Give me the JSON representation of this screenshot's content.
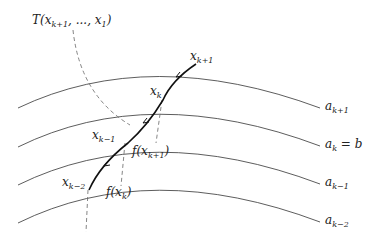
{
  "diagram": {
    "title_label": "T(x_{k+1}, ..., x_1)",
    "level_curves": [
      {
        "name": "a_{k+1}",
        "label_main": "a",
        "label_sub": "k+1",
        "label_suffix": ""
      },
      {
        "name": "a_k = b",
        "label_main": "a",
        "label_sub": "k",
        "label_suffix": " = b"
      },
      {
        "name": "a_{k-1}",
        "label_main": "a",
        "label_sub": "k−1",
        "label_suffix": ""
      },
      {
        "name": "a_{k-2}",
        "label_main": "a",
        "label_sub": "k−2",
        "label_suffix": ""
      }
    ],
    "points": [
      {
        "name": "x_{k+1}",
        "main": "x",
        "sub": "k+1"
      },
      {
        "name": "x_k",
        "main": "x",
        "sub": "k"
      },
      {
        "name": "x_{k-1}",
        "main": "x",
        "sub": "k−1"
      },
      {
        "name": "x_{k-2}",
        "main": "x",
        "sub": "k−2"
      }
    ],
    "images": [
      {
        "name": "f(x_{k+1})",
        "pre": "f(x",
        "sub": "k+1",
        "post": ")"
      },
      {
        "name": "f(x_k)",
        "pre": "f(x",
        "sub": "k",
        "post": ")"
      }
    ],
    "T_label": {
      "pre": "T(x",
      "sub1": "k+1",
      "mid": ", ..., x",
      "sub2": "1",
      "post": ")"
    },
    "colors": {
      "curve": "#333333",
      "path": "#111111",
      "dashed": "#666666"
    }
  }
}
